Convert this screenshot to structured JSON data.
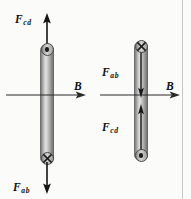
{
  "figure": {
    "background_color": "#fbfbfa",
    "frame_rule_color": "#c8c8c8"
  },
  "panels": [
    {
      "id": "left-panel",
      "name": "left-rod-diagram",
      "rod": {
        "orientation": "vertical",
        "top_marker": "current-out-of-page-dot",
        "top_marker_symbol": "⊙",
        "bottom_marker": "current-into-page-cross",
        "bottom_marker_symbol": "⊗",
        "internal_arrows": []
      },
      "field": {
        "label_main": "B",
        "label_sub": "",
        "direction": "right",
        "name": "magnetic-field-vector"
      },
      "forces": [
        {
          "label_main": "F",
          "label_sub": "cd",
          "direction": "up",
          "position": "above-rod",
          "name": "force-cd-vector"
        },
        {
          "label_main": "F",
          "label_sub": "ab",
          "direction": "down",
          "position": "below-rod",
          "name": "force-ab-vector"
        }
      ]
    },
    {
      "id": "right-panel",
      "name": "right-rod-diagram",
      "rod": {
        "orientation": "vertical",
        "top_marker": "current-into-page-cross",
        "top_marker_symbol": "⊗",
        "bottom_marker": "current-out-of-page-dot",
        "bottom_marker_symbol": "⊙",
        "internal_arrows": [
          {
            "direction": "down",
            "half": "upper",
            "name": "force-ab-inner-arrow"
          },
          {
            "direction": "up",
            "half": "lower",
            "name": "force-cd-inner-arrow"
          }
        ]
      },
      "field": {
        "label_main": "B",
        "label_sub": "",
        "direction": "right",
        "name": "magnetic-field-vector"
      },
      "forces": [
        {
          "label_main": "F",
          "label_sub": "ab",
          "direction": "down",
          "position": "inside-rod-upper",
          "name": "force-ab-vector"
        },
        {
          "label_main": "F",
          "label_sub": "cd",
          "direction": "up",
          "position": "inside-rod-lower",
          "name": "force-cd-vector"
        }
      ]
    }
  ]
}
